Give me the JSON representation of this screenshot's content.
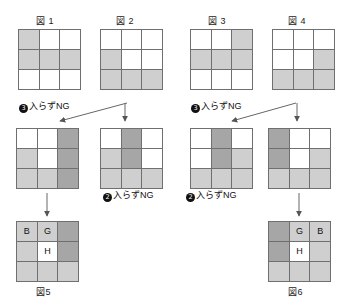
{
  "page": {
    "shade_color": "#cfcfcf",
    "dark_color": "#a6a6a6",
    "line_color": "#6f6f6f",
    "bg_color": "#ffffff"
  },
  "captions": {
    "fig1": "図 1",
    "fig2": "図 2",
    "fig3": "図 3",
    "fig4": "図 4",
    "fig5": "図5",
    "fig6": "図6"
  },
  "notes": {
    "ng3_a": {
      "num": "3",
      "text": "入らずNG"
    },
    "ng3_b": {
      "num": "3",
      "text": "入らずNG"
    },
    "ng2_a": {
      "num": "2",
      "text": "入らずNG"
    },
    "ng2_b": {
      "num": "2",
      "text": "入らずNG"
    }
  },
  "grids": {
    "top1": {
      "name": "図 1",
      "cells": [
        {
          "fill": "shade",
          "label": ""
        },
        {
          "fill": "none",
          "label": ""
        },
        {
          "fill": "none",
          "label": ""
        },
        {
          "fill": "shade",
          "label": ""
        },
        {
          "fill": "shade",
          "label": ""
        },
        {
          "fill": "shade",
          "label": ""
        },
        {
          "fill": "none",
          "label": ""
        },
        {
          "fill": "none",
          "label": ""
        },
        {
          "fill": "none",
          "label": ""
        }
      ]
    },
    "top2": {
      "name": "図 2",
      "cells": [
        {
          "fill": "none",
          "label": ""
        },
        {
          "fill": "none",
          "label": ""
        },
        {
          "fill": "none",
          "label": ""
        },
        {
          "fill": "shade",
          "label": ""
        },
        {
          "fill": "none",
          "label": ""
        },
        {
          "fill": "none",
          "label": ""
        },
        {
          "fill": "shade",
          "label": ""
        },
        {
          "fill": "shade",
          "label": ""
        },
        {
          "fill": "shade",
          "label": ""
        }
      ]
    },
    "top3": {
      "name": "図 3",
      "cells": [
        {
          "fill": "none",
          "label": ""
        },
        {
          "fill": "none",
          "label": ""
        },
        {
          "fill": "shade",
          "label": ""
        },
        {
          "fill": "shade",
          "label": ""
        },
        {
          "fill": "shade",
          "label": ""
        },
        {
          "fill": "shade",
          "label": ""
        },
        {
          "fill": "none",
          "label": ""
        },
        {
          "fill": "none",
          "label": ""
        },
        {
          "fill": "none",
          "label": ""
        }
      ]
    },
    "top4": {
      "name": "図 4",
      "cells": [
        {
          "fill": "none",
          "label": ""
        },
        {
          "fill": "none",
          "label": ""
        },
        {
          "fill": "none",
          "label": ""
        },
        {
          "fill": "none",
          "label": ""
        },
        {
          "fill": "none",
          "label": ""
        },
        {
          "fill": "shade",
          "label": ""
        },
        {
          "fill": "shade",
          "label": ""
        },
        {
          "fill": "shade",
          "label": ""
        },
        {
          "fill": "shade",
          "label": ""
        }
      ]
    },
    "mid1": {
      "name": "中段1",
      "cells": [
        {
          "fill": "none",
          "label": ""
        },
        {
          "fill": "none",
          "label": ""
        },
        {
          "fill": "dark",
          "label": ""
        },
        {
          "fill": "shade",
          "label": ""
        },
        {
          "fill": "none",
          "label": ""
        },
        {
          "fill": "dark",
          "label": ""
        },
        {
          "fill": "shade",
          "label": ""
        },
        {
          "fill": "shade",
          "label": ""
        },
        {
          "fill": "dark",
          "label": ""
        }
      ]
    },
    "mid2": {
      "name": "中段2",
      "cells": [
        {
          "fill": "none",
          "label": ""
        },
        {
          "fill": "dark",
          "label": ""
        },
        {
          "fill": "none",
          "label": ""
        },
        {
          "fill": "shade",
          "label": ""
        },
        {
          "fill": "dark",
          "label": ""
        },
        {
          "fill": "none",
          "label": ""
        },
        {
          "fill": "shade",
          "label": ""
        },
        {
          "fill": "shade",
          "label": ""
        },
        {
          "fill": "shade",
          "label": ""
        }
      ]
    },
    "mid3": {
      "name": "中段3",
      "cells": [
        {
          "fill": "none",
          "label": ""
        },
        {
          "fill": "dark",
          "label": ""
        },
        {
          "fill": "none",
          "label": ""
        },
        {
          "fill": "none",
          "label": ""
        },
        {
          "fill": "dark",
          "label": ""
        },
        {
          "fill": "shade",
          "label": ""
        },
        {
          "fill": "shade",
          "label": ""
        },
        {
          "fill": "shade",
          "label": ""
        },
        {
          "fill": "shade",
          "label": ""
        }
      ]
    },
    "mid4": {
      "name": "中段4",
      "cells": [
        {
          "fill": "dark",
          "label": ""
        },
        {
          "fill": "none",
          "label": ""
        },
        {
          "fill": "none",
          "label": ""
        },
        {
          "fill": "dark",
          "label": ""
        },
        {
          "fill": "none",
          "label": ""
        },
        {
          "fill": "shade",
          "label": ""
        },
        {
          "fill": "shade",
          "label": ""
        },
        {
          "fill": "shade",
          "label": ""
        },
        {
          "fill": "shade",
          "label": ""
        }
      ]
    },
    "fig5": {
      "name": "図5",
      "cells": [
        {
          "fill": "shade",
          "label": "B"
        },
        {
          "fill": "shade",
          "label": "G"
        },
        {
          "fill": "dark",
          "label": ""
        },
        {
          "fill": "shade",
          "label": ""
        },
        {
          "fill": "none",
          "label": "H"
        },
        {
          "fill": "dark",
          "label": ""
        },
        {
          "fill": "shade",
          "label": ""
        },
        {
          "fill": "shade",
          "label": ""
        },
        {
          "fill": "shade",
          "label": ""
        }
      ]
    },
    "fig6": {
      "name": "図6",
      "cells": [
        {
          "fill": "dark",
          "label": ""
        },
        {
          "fill": "shade",
          "label": "G"
        },
        {
          "fill": "shade",
          "label": "B"
        },
        {
          "fill": "dark",
          "label": ""
        },
        {
          "fill": "none",
          "label": "H"
        },
        {
          "fill": "shade",
          "label": ""
        },
        {
          "fill": "shade",
          "label": ""
        },
        {
          "fill": "shade",
          "label": ""
        },
        {
          "fill": "shade",
          "label": ""
        }
      ]
    }
  }
}
